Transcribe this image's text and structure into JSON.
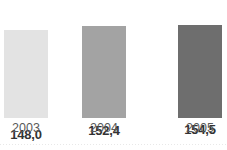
{
  "chart_data": {
    "type": "bar",
    "title": "",
    "subtitle": "",
    "xlabel": "",
    "ylabel": "",
    "categories": [
      "2003",
      "2004",
      "2005"
    ],
    "values": [
      148.0,
      152.4,
      154.5
    ],
    "value_labels": [
      "148,0",
      "152,4",
      "154,5"
    ],
    "decimal_separator": ",",
    "series": [
      {
        "name": "",
        "values": [
          148.0,
          152.4,
          154.5
        ],
        "value_labels": [
          "148,0",
          "152,4",
          "154,5"
        ]
      }
    ],
    "bar_colors": [
      "#e3e3e3",
      "#a3a3a3",
      "#6e6e6e"
    ],
    "ylim": [
      145.0,
      155.6
    ],
    "axis_starts_at_zero": false,
    "grid": false,
    "y_axis_visible": false,
    "x_axis_line_visible": false,
    "legend": null,
    "legend_position": "none",
    "data_labels_position": "above-bar",
    "annotations": []
  },
  "bars": [
    {
      "category": "2003",
      "value_label": "148,0",
      "color": "#e3e3e3",
      "height_px": 88,
      "label_top_px": 10
    },
    {
      "category": "2004",
      "value_label": "152,4",
      "color": "#a3a3a3",
      "height_px": 92,
      "label_top_px": 6
    },
    {
      "category": "2005",
      "value_label": "154,5",
      "color": "#6e6e6e",
      "height_px": 93,
      "label_top_px": 5
    }
  ],
  "style": {
    "background": "#ffffff",
    "value_label_color": "#333333",
    "category_label_color": "#5a5a5a",
    "rule_color": "#e8e8e8"
  }
}
